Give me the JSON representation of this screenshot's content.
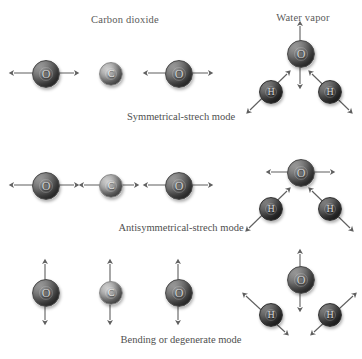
{
  "figure": {
    "headings": [
      {
        "text": "Carbon dioxide",
        "x": 125,
        "y": 14
      },
      {
        "text": "Water vapor",
        "x": 303,
        "y": 12
      }
    ],
    "captions": [
      {
        "text": "Symmetrical-strech mode",
        "y": 111
      },
      {
        "text": "Antisymmetrical-strech mode",
        "y": 222
      },
      {
        "text": "Bending or degenerate mode",
        "y": 334
      }
    ],
    "colors": {
      "background": "#ffffff",
      "oxygen": "#6f6f6f",
      "carbon": "#ababab",
      "hydrogen": "#545454",
      "arrow": "#5f5f5f",
      "text": "#4f4f4f"
    },
    "atom_labels": {
      "oxygen": "O",
      "carbon": "C",
      "hydrogen": "H"
    },
    "molecules": [
      {
        "name": "carbon-dioxide-symmetrical-stretch",
        "atoms": [
          {
            "element": "O",
            "label": "O",
            "x": 45,
            "y": 73,
            "r": 13
          },
          {
            "element": "C",
            "label": "C",
            "x": 110,
            "y": 73,
            "r": 11
          },
          {
            "element": "O",
            "label": "O",
            "x": 178,
            "y": 73,
            "r": 13
          }
        ],
        "arrows": [
          {
            "x1": 14,
            "y1": 73,
            "x2": 74,
            "y2": 73
          },
          {
            "x1": 148,
            "y1": 73,
            "x2": 208,
            "y2": 73
          }
        ]
      },
      {
        "name": "water-vapor-symmetrical-stretch",
        "atoms": [
          {
            "element": "O",
            "label": "O",
            "x": 300,
            "y": 53,
            "r": 13
          },
          {
            "element": "H",
            "label": "H",
            "x": 270,
            "y": 91,
            "r": 11
          },
          {
            "element": "H",
            "label": "H",
            "x": 329,
            "y": 91,
            "r": 11
          }
        ],
        "arrows": [
          {
            "x1": 300,
            "y1": 26,
            "x2": 300,
            "y2": 84
          },
          {
            "x1": 250,
            "y1": 110,
            "x2": 287,
            "y2": 74
          },
          {
            "x1": 349,
            "y1": 110,
            "x2": 312,
            "y2": 74
          }
        ]
      },
      {
        "name": "carbon-dioxide-antisymmetrical-stretch",
        "atoms": [
          {
            "element": "O",
            "label": "O",
            "x": 45,
            "y": 185,
            "r": 13
          },
          {
            "element": "C",
            "label": "C",
            "x": 110,
            "y": 185,
            "r": 11
          },
          {
            "element": "O",
            "label": "O",
            "x": 178,
            "y": 185,
            "r": 13
          }
        ],
        "arrows": [
          {
            "x1": 14,
            "y1": 185,
            "x2": 74,
            "y2": 185
          },
          {
            "x1": 84,
            "y1": 185,
            "x2": 134,
            "y2": 185
          },
          {
            "x1": 148,
            "y1": 185,
            "x2": 208,
            "y2": 185
          }
        ]
      },
      {
        "name": "water-vapor-antisymmetrical-stretch",
        "atoms": [
          {
            "element": "O",
            "label": "O",
            "x": 300,
            "y": 172,
            "r": 13
          },
          {
            "element": "H",
            "label": "H",
            "x": 270,
            "y": 208,
            "r": 11
          },
          {
            "element": "H",
            "label": "H",
            "x": 329,
            "y": 208,
            "r": 11
          }
        ],
        "arrows": [
          {
            "x1": 271,
            "y1": 172,
            "x2": 330,
            "y2": 172
          },
          {
            "x1": 249,
            "y1": 228,
            "x2": 287,
            "y2": 191
          },
          {
            "x1": 350,
            "y1": 228,
            "x2": 312,
            "y2": 191
          }
        ]
      },
      {
        "name": "carbon-dioxide-bending",
        "atoms": [
          {
            "element": "O",
            "label": "O",
            "x": 45,
            "y": 292,
            "r": 13
          },
          {
            "element": "C",
            "label": "C",
            "x": 110,
            "y": 292,
            "r": 11
          },
          {
            "element": "O",
            "label": "O",
            "x": 178,
            "y": 292,
            "r": 13
          }
        ],
        "arrows": [
          {
            "x1": 45,
            "y1": 264,
            "x2": 45,
            "y2": 320
          },
          {
            "x1": 110,
            "y1": 264,
            "x2": 110,
            "y2": 320
          },
          {
            "x1": 178,
            "y1": 264,
            "x2": 178,
            "y2": 320
          }
        ]
      },
      {
        "name": "water-vapor-bending",
        "atoms": [
          {
            "element": "O",
            "label": "O",
            "x": 300,
            "y": 279,
            "r": 13
          },
          {
            "element": "H",
            "label": "H",
            "x": 270,
            "y": 314,
            "r": 11
          },
          {
            "element": "H",
            "label": "H",
            "x": 329,
            "y": 314,
            "r": 11
          }
        ],
        "arrows": [
          {
            "x1": 300,
            "y1": 254,
            "x2": 300,
            "y2": 307
          },
          {
            "x1": 246,
            "y1": 296,
            "x2": 285,
            "y2": 332
          },
          {
            "x1": 353,
            "y1": 296,
            "x2": 314,
            "y2": 332
          }
        ]
      }
    ]
  }
}
